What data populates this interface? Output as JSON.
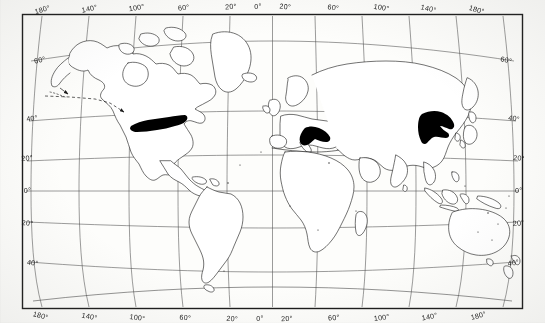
{
  "figure": {
    "kind": "world-distribution-map",
    "projection": "curved-graticule pseudocylindrical",
    "background_color": "#fdfdfb",
    "ink_color": "#1b1b1b",
    "fill_color": "#000000",
    "frame": {
      "x": 22,
      "y": 14,
      "width": 501,
      "height": 295
    }
  },
  "axes": {
    "longitude_top": [
      "180°",
      "140°",
      "100°",
      "60°",
      "20°",
      "0°",
      "20°",
      "60°",
      "100°",
      "140°",
      "180°"
    ],
    "longitude_bottom": [
      "180°",
      "140°",
      "100°",
      "60°",
      "20°",
      "0°",
      "20°",
      "60°",
      "100°",
      "140°",
      "180°"
    ],
    "latitude_left": [
      "60°",
      "40°",
      "20°",
      "0°",
      "20°",
      "40°"
    ],
    "latitude_right": [
      "60°",
      "40°",
      "20°",
      "0°",
      "20°",
      "40°"
    ],
    "longitude_values": [
      -180,
      -140,
      -100,
      -60,
      -20,
      0,
      20,
      60,
      100,
      140,
      180
    ],
    "latitude_values": [
      60,
      40,
      20,
      0,
      -20,
      -40
    ],
    "graticule_spacing_deg": 20,
    "grid": true
  },
  "shaded_regions": [
    {
      "name": "eastern-north-america",
      "label": "Eastern North America",
      "approx_lat_range": [
        34,
        44
      ],
      "approx_lon_range": [
        -92,
        -70
      ],
      "fill": "#000000"
    },
    {
      "name": "central-europe",
      "label": "Central Europe",
      "approx_lat_range": [
        44,
        53
      ],
      "approx_lon_range": [
        8,
        26
      ],
      "fill": "#000000"
    },
    {
      "name": "eastern-china",
      "label": "Eastern China",
      "approx_lat_range": [
        28,
        42
      ],
      "approx_lon_range": [
        105,
        124
      ],
      "fill": "#000000"
    }
  ],
  "annotations": [
    {
      "name": "pacific-dashed-arrow",
      "style": "dashed-line-with-arrowhead",
      "from": "north-pacific",
      "to": "eastern-north-america"
    }
  ],
  "continents": [
    "north-america",
    "south-america",
    "greenland",
    "iceland",
    "europe",
    "africa",
    "asia",
    "australia",
    "new-zealand",
    "japan",
    "madagascar",
    "indonesia",
    "british-isles",
    "scandinavia"
  ]
}
